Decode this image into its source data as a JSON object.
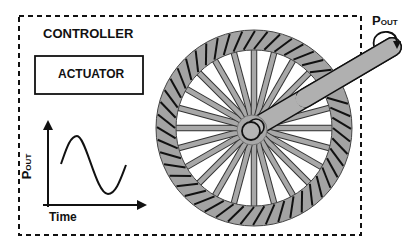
{
  "diagram": {
    "controller": {
      "label": "CONTROLLER"
    },
    "actuator": {
      "label": "ACTUATOR"
    },
    "plot": {
      "ylabel_main": "P",
      "ylabel_sub": "OUT",
      "xlabel": "Time",
      "curve": "sine"
    },
    "output": {
      "label_main": "P",
      "label_sub": "OUT"
    },
    "wheel": {
      "spokes": 24,
      "tread_hatches": 48
    },
    "colors": {
      "stroke": "#111111",
      "wheel_fill": "#a3a3a3",
      "spoke_fill": "#a8a8a8",
      "background": "#ffffff"
    }
  }
}
